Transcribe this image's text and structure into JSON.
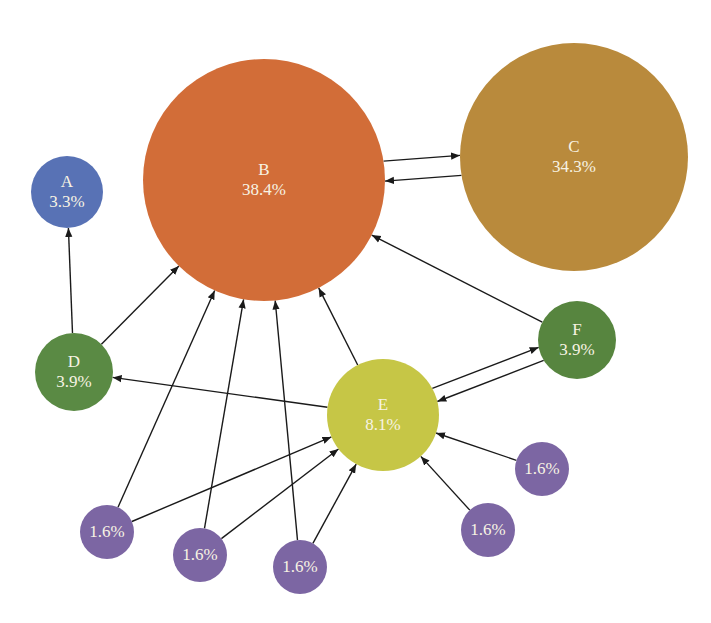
{
  "diagram": {
    "type": "directed-graph",
    "nodes": [
      {
        "id": "A",
        "label": "A",
        "value": "3.3%",
        "cx": 67,
        "cy": 192,
        "r": 36,
        "color": "#5872b5"
      },
      {
        "id": "B",
        "label": "B",
        "value": "38.4%",
        "cx": 264,
        "cy": 180,
        "r": 121,
        "color": "#d26d38"
      },
      {
        "id": "C",
        "label": "C",
        "value": "34.3%",
        "cx": 574,
        "cy": 157,
        "r": 114,
        "color": "#b98a3c"
      },
      {
        "id": "D",
        "label": "D",
        "value": "3.9%",
        "cx": 74,
        "cy": 372,
        "r": 39,
        "color": "#5a8a44"
      },
      {
        "id": "E",
        "label": "E",
        "value": "8.1%",
        "cx": 383,
        "cy": 415,
        "r": 56,
        "color": "#c6c646"
      },
      {
        "id": "F",
        "label": "F",
        "value": "3.9%",
        "cx": 577,
        "cy": 340,
        "r": 39,
        "color": "#57853f"
      },
      {
        "id": "P1",
        "label": "",
        "value": "1.6%",
        "cx": 107,
        "cy": 532,
        "r": 27,
        "color": "#7c66a3"
      },
      {
        "id": "P2",
        "label": "",
        "value": "1.6%",
        "cx": 200,
        "cy": 555,
        "r": 27,
        "color": "#7c66a3"
      },
      {
        "id": "P3",
        "label": "",
        "value": "1.6%",
        "cx": 300,
        "cy": 567,
        "r": 27,
        "color": "#7c66a3"
      },
      {
        "id": "P4",
        "label": "",
        "value": "1.6%",
        "cx": 488,
        "cy": 530,
        "r": 27,
        "color": "#7c66a3"
      },
      {
        "id": "P5",
        "label": "",
        "value": "1.6%",
        "cx": 542,
        "cy": 469,
        "r": 27,
        "color": "#7c66a3"
      }
    ],
    "edges": [
      {
        "from": "B",
        "to": "C",
        "offset": -10
      },
      {
        "from": "C",
        "to": "B",
        "offset": -10
      },
      {
        "from": "D",
        "to": "A",
        "offset": 0
      },
      {
        "from": "D",
        "to": "B",
        "offset": 0
      },
      {
        "from": "E",
        "to": "B",
        "offset": 0
      },
      {
        "from": "E",
        "to": "D",
        "offset": 0
      },
      {
        "from": "E",
        "to": "F",
        "offset": -7
      },
      {
        "from": "F",
        "to": "E",
        "offset": -7
      },
      {
        "from": "F",
        "to": "B",
        "offset": 0
      },
      {
        "from": "P1",
        "to": "B",
        "offset": 0
      },
      {
        "from": "P1",
        "to": "E",
        "offset": 0
      },
      {
        "from": "P2",
        "to": "B",
        "offset": 0
      },
      {
        "from": "P2",
        "to": "E",
        "offset": 0
      },
      {
        "from": "P3",
        "to": "B",
        "offset": 0
      },
      {
        "from": "P3",
        "to": "E",
        "offset": 0
      },
      {
        "from": "P4",
        "to": "E",
        "offset": 0
      },
      {
        "from": "P5",
        "to": "E",
        "offset": 0
      }
    ],
    "edge_color": "#1a1a1a",
    "text_color": "#f7f3e3"
  }
}
